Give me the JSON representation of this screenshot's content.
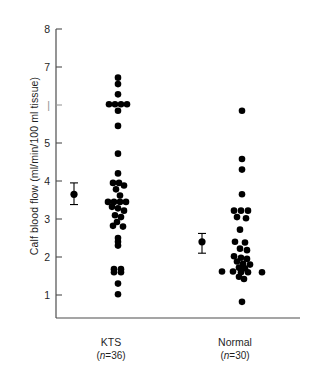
{
  "chart_data": {
    "type": "scatter",
    "title": "",
    "xlabel": "",
    "ylabel": "Calf blood flow (ml/min/100 ml tissue)",
    "ylim": [
      0.55,
      8.0
    ],
    "yticks": [
      1,
      2,
      3,
      4,
      5,
      6,
      7,
      8
    ],
    "ytick_labels": [
      "1",
      "2",
      "3",
      "4",
      "5",
      "6",
      "7",
      "8"
    ],
    "grid": false,
    "legend": "none",
    "categories": [
      "KTS",
      "Normal"
    ],
    "series": [
      {
        "name": "KTS",
        "n_label": "(n=36)",
        "n": 36,
        "points": [
          {
            "value": 6.72,
            "offset": 0
          },
          {
            "value": 6.55,
            "offset": 0
          },
          {
            "value": 6.28,
            "offset": 0
          },
          {
            "value": 6.02,
            "offset": -9
          },
          {
            "value": 6.02,
            "offset": -3
          },
          {
            "value": 6.02,
            "offset": 3
          },
          {
            "value": 6.02,
            "offset": 9
          },
          {
            "value": 5.85,
            "offset": 0
          },
          {
            "value": 5.45,
            "offset": 0
          },
          {
            "value": 4.72,
            "offset": 0
          },
          {
            "value": 4.2,
            "offset": 0
          },
          {
            "value": 3.95,
            "offset": -5
          },
          {
            "value": 3.95,
            "offset": 1
          },
          {
            "value": 3.88,
            "offset": 6
          },
          {
            "value": 3.78,
            "offset": -2
          },
          {
            "value": 3.62,
            "offset": 2
          },
          {
            "value": 3.45,
            "offset": -10
          },
          {
            "value": 3.45,
            "offset": -4
          },
          {
            "value": 3.45,
            "offset": 2
          },
          {
            "value": 3.45,
            "offset": 8
          },
          {
            "value": 3.32,
            "offset": -6
          },
          {
            "value": 3.28,
            "offset": 0
          },
          {
            "value": 3.22,
            "offset": 6
          },
          {
            "value": 3.1,
            "offset": -3
          },
          {
            "value": 3.05,
            "offset": 3
          },
          {
            "value": 2.92,
            "offset": -1
          },
          {
            "value": 2.82,
            "offset": -5
          },
          {
            "value": 2.8,
            "offset": 5
          },
          {
            "value": 2.5,
            "offset": 0
          },
          {
            "value": 2.4,
            "offset": 0
          },
          {
            "value": 2.3,
            "offset": 0
          },
          {
            "value": 1.68,
            "offset": -4
          },
          {
            "value": 1.68,
            "offset": 3
          },
          {
            "value": 1.6,
            "offset": -4
          },
          {
            "value": 1.6,
            "offset": 3
          },
          {
            "value": 1.3,
            "offset": 0
          },
          {
            "value": 1.02,
            "offset": 0
          }
        ],
        "mean": 3.65,
        "sem_upper": 3.95,
        "sem_lower": 3.38
      },
      {
        "name": "Normal",
        "n_label": "(n=30)",
        "n": 30,
        "points": [
          {
            "value": 5.85,
            "offset": 0
          },
          {
            "value": 4.58,
            "offset": 0
          },
          {
            "value": 4.3,
            "offset": 0
          },
          {
            "value": 3.65,
            "offset": 0
          },
          {
            "value": 3.22,
            "offset": -8
          },
          {
            "value": 3.22,
            "offset": -1
          },
          {
            "value": 3.22,
            "offset": 6
          },
          {
            "value": 3.05,
            "offset": -5
          },
          {
            "value": 3.02,
            "offset": 4
          },
          {
            "value": 2.72,
            "offset": -2
          },
          {
            "value": 2.4,
            "offset": -7
          },
          {
            "value": 2.38,
            "offset": 3
          },
          {
            "value": 2.22,
            "offset": -2
          },
          {
            "value": 2.18,
            "offset": 5
          },
          {
            "value": 2.02,
            "offset": -8
          },
          {
            "value": 1.98,
            "offset": -1
          },
          {
            "value": 1.95,
            "offset": 5
          },
          {
            "value": 1.88,
            "offset": -5
          },
          {
            "value": 1.82,
            "offset": 1
          },
          {
            "value": 1.8,
            "offset": 8
          },
          {
            "value": 1.72,
            "offset": -3
          },
          {
            "value": 1.7,
            "offset": 3
          },
          {
            "value": 1.62,
            "offset": -20
          },
          {
            "value": 1.62,
            "offset": -9
          },
          {
            "value": 1.6,
            "offset": -1
          },
          {
            "value": 1.6,
            "offset": 6
          },
          {
            "value": 1.6,
            "offset": 20
          },
          {
            "value": 1.48,
            "offset": -3
          },
          {
            "value": 1.42,
            "offset": 2
          },
          {
            "value": 0.82,
            "offset": 0
          }
        ],
        "mean": 2.4,
        "sem_upper": 2.62,
        "sem_lower": 2.1
      }
    ],
    "colors": {
      "point": "#000000",
      "axis": "#4d4d4d",
      "text": "#1f1f1f"
    }
  }
}
